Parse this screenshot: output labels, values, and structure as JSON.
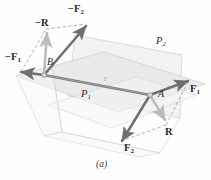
{
  "figure": {
    "caption": "(a)",
    "intersection_label": "Γ",
    "planes": [
      {
        "name": "plane-p1",
        "label": "P",
        "sub": "1",
        "orientation": "horizontal"
      },
      {
        "name": "plane-p2",
        "label": "P",
        "sub": "2",
        "orientation": "inclined"
      }
    ],
    "points": [
      {
        "name": "point-a",
        "label": "A"
      },
      {
        "name": "point-b",
        "label": "B"
      }
    ],
    "vectors": [
      {
        "name": "vector-neg-f1",
        "sign": "−",
        "base": "F",
        "sub": "1"
      },
      {
        "name": "vector-neg-f2",
        "sign": "−",
        "base": "F",
        "sub": "2"
      },
      {
        "name": "vector-neg-r",
        "sign": "−",
        "base": "R",
        "sub": ""
      },
      {
        "name": "vector-f1",
        "sign": "",
        "base": "F",
        "sub": "1"
      },
      {
        "name": "vector-f2",
        "sign": "",
        "base": "F",
        "sub": "2"
      },
      {
        "name": "vector-r",
        "sign": "",
        "base": "R",
        "sub": ""
      }
    ]
  },
  "colors": {
    "vector_dark": "#6f6f6f",
    "vector_light": "#b9b9b9",
    "plane_fill": "#ededed",
    "plane_edge": "#c8c8c8",
    "dashed": "#9a9a9a",
    "text": "#2b2b2b"
  }
}
